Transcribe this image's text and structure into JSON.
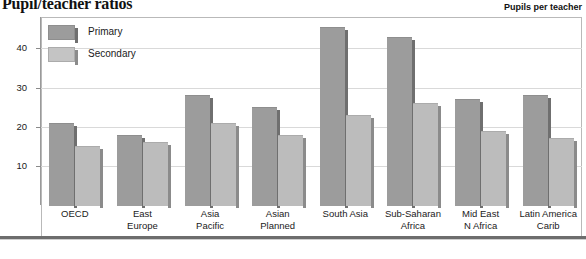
{
  "header": {
    "title": "Pupil/teacher ratios",
    "axis_note": "Pupils per teacher"
  },
  "legend": {
    "items": [
      {
        "label": "Primary",
        "color": "#9c9c9c"
      },
      {
        "label": "Secondary",
        "color": "#c4c4c4"
      }
    ]
  },
  "chart_data": {
    "type": "bar",
    "title": "Pupil/teacher ratios",
    "xlabel": "",
    "ylabel": "Pupils per teacher",
    "ylim": [
      0,
      48
    ],
    "yticks": [
      10,
      20,
      30,
      40
    ],
    "grid": true,
    "legend_position": "top-left",
    "categories": [
      "OECD",
      "East Europe",
      "Asia Pacific",
      "Asian Planned",
      "South Asia",
      "Sub-Saharan Africa",
      "Mid East N Africa",
      "Latin America Carib"
    ],
    "category_lines": [
      [
        "OECD"
      ],
      [
        "East",
        "Europe"
      ],
      [
        "Asia",
        "Pacific"
      ],
      [
        "Asian",
        "Planned"
      ],
      [
        "South Asia"
      ],
      [
        "Sub-Saharan",
        "Africa"
      ],
      [
        "Mid East",
        "N Africa"
      ],
      [
        "Latin America",
        "Carib"
      ]
    ],
    "series": [
      {
        "name": "Primary",
        "color": "#9c9c9c",
        "values": [
          21,
          18,
          28,
          25,
          45.5,
          43,
          27,
          28
        ]
      },
      {
        "name": "Secondary",
        "color": "#bcbcbc",
        "values": [
          15,
          16,
          21,
          18,
          23,
          26,
          19,
          17
        ]
      }
    ]
  }
}
